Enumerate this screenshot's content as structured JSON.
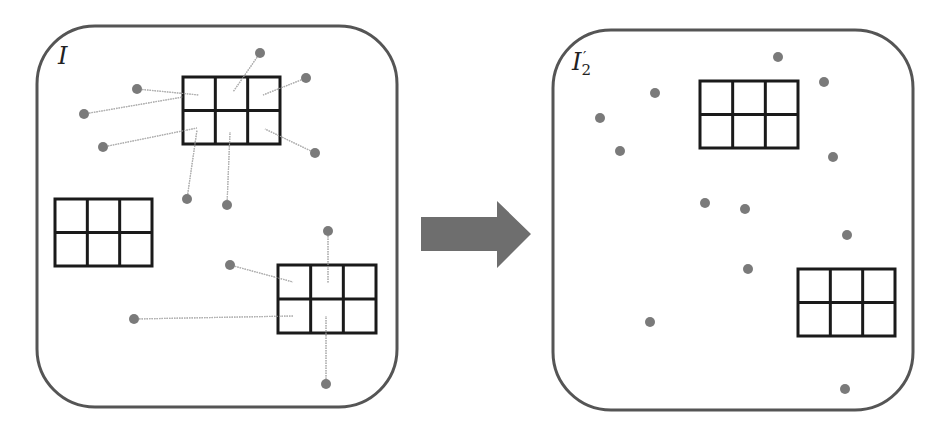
{
  "diagram": {
    "colors": {
      "panel_border": "#555555",
      "grid_stroke": "#1a1a1a",
      "dot_fill": "#7a7a7a",
      "link_line": "#b0b0b0",
      "arrow_fill": "#6e6e6e",
      "background": "#ffffff"
    },
    "left_panel": {
      "label_main": "I",
      "label_sub": "",
      "label_sup": "",
      "box": {
        "x": 37,
        "y": 26,
        "w": 360,
        "h": 381,
        "r": 58
      },
      "grids": [
        {
          "x": 183,
          "y": 77,
          "w": 97,
          "h": 67,
          "cols": 3,
          "rows": 2
        },
        {
          "x": 55,
          "y": 199,
          "w": 97,
          "h": 67,
          "cols": 3,
          "rows": 2
        },
        {
          "x": 278,
          "y": 265,
          "w": 98,
          "h": 68,
          "cols": 3,
          "rows": 2
        }
      ],
      "points": [
        {
          "x": 137,
          "y": 89,
          "link_to": [
            199,
            95
          ]
        },
        {
          "x": 84,
          "y": 114,
          "link_to": [
            183,
            97
          ]
        },
        {
          "x": 103,
          "y": 147,
          "link_to": [
            197,
            128
          ]
        },
        {
          "x": 260,
          "y": 53,
          "link_to": [
            233,
            92
          ]
        },
        {
          "x": 306,
          "y": 78,
          "link_to": [
            263,
            95
          ]
        },
        {
          "x": 315,
          "y": 153,
          "link_to": [
            265,
            129
          ]
        },
        {
          "x": 187,
          "y": 199,
          "link_to": [
            197,
            130
          ]
        },
        {
          "x": 227,
          "y": 205,
          "link_to": [
            230,
            132
          ]
        },
        {
          "x": 230,
          "y": 265,
          "link_to": [
            293,
            282
          ]
        },
        {
          "x": 134,
          "y": 319,
          "link_to": [
            293,
            316
          ]
        },
        {
          "x": 328,
          "y": 231,
          "link_to": [
            328,
            283
          ]
        },
        {
          "x": 326,
          "y": 384,
          "link_to": [
            326,
            316
          ]
        }
      ]
    },
    "arrow": {
      "direction": "right",
      "shaft": {
        "x": 421,
        "y": 217,
        "w": 77,
        "h": 34
      },
      "head": {
        "base_x": 497,
        "tip_x": 531,
        "top_y": 201,
        "bottom_y": 268,
        "mid_y": 234
      }
    },
    "right_panel": {
      "label_main": "I",
      "label_sub": "2",
      "label_sup": "′",
      "box": {
        "x": 553,
        "y": 30,
        "w": 360,
        "h": 380,
        "r": 58
      },
      "grids": [
        {
          "x": 700,
          "y": 81,
          "w": 98,
          "h": 67,
          "cols": 3,
          "rows": 2
        },
        {
          "x": 798,
          "y": 269,
          "w": 97,
          "h": 67,
          "cols": 3,
          "rows": 2
        }
      ],
      "points": [
        {
          "x": 778,
          "y": 57
        },
        {
          "x": 824,
          "y": 82
        },
        {
          "x": 655,
          "y": 93
        },
        {
          "x": 600,
          "y": 118
        },
        {
          "x": 620,
          "y": 151
        },
        {
          "x": 833,
          "y": 157
        },
        {
          "x": 705,
          "y": 203
        },
        {
          "x": 745,
          "y": 209
        },
        {
          "x": 847,
          "y": 235
        },
        {
          "x": 748,
          "y": 269
        },
        {
          "x": 650,
          "y": 322
        },
        {
          "x": 845,
          "y": 389
        }
      ]
    }
  }
}
